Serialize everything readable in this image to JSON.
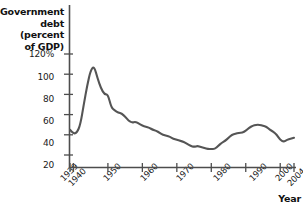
{
  "chart_data": {
    "type": "line",
    "title": "",
    "ylabel": "Government\ndebt (percent\nof GDP)",
    "xlabel": "Year",
    "ytick_labels": [
      "120%",
      "100",
      "80",
      "60",
      "40",
      "20"
    ],
    "ytick_values": [
      120,
      100,
      80,
      60,
      40,
      20
    ],
    "ylim": [
      0,
      130
    ],
    "xtick_labels": [
      "1939",
      "1940",
      "1950",
      "1960",
      "1970",
      "1980",
      "1990",
      "2000",
      "2004"
    ],
    "xtick_values": [
      1939,
      1940,
      1950,
      1960,
      1970,
      1980,
      1990,
      2000,
      2004
    ],
    "xlim": [
      1939,
      2004
    ],
    "grid": false,
    "legend": null,
    "series": [
      {
        "name": "Government debt (percent of GDP)",
        "color": "#555555",
        "x": [
          1939,
          1940,
          1941,
          1942,
          1943,
          1944,
          1945,
          1946,
          1947,
          1948,
          1949,
          1950,
          1951,
          1952,
          1953,
          1954,
          1955,
          1956,
          1957,
          1958,
          1959,
          1960,
          1961,
          1962,
          1963,
          1964,
          1965,
          1966,
          1967,
          1968,
          1969,
          1970,
          1971,
          1972,
          1973,
          1974,
          1975,
          1976,
          1977,
          1978,
          1979,
          1980,
          1981,
          1982,
          1983,
          1984,
          1985,
          1986,
          1987,
          1988,
          1989,
          1990,
          1991,
          1992,
          1993,
          1994,
          1995,
          1996,
          1997,
          1998,
          1999,
          2000,
          2001,
          2002,
          2003,
          2004
        ],
        "y": [
          45,
          41,
          42,
          50,
          70,
          89,
          104,
          108,
          96,
          86,
          80,
          80,
          67,
          64,
          62,
          61,
          58,
          54,
          52,
          53,
          51,
          49,
          48,
          47,
          45,
          44,
          42,
          40,
          39,
          38,
          36,
          35,
          34,
          33,
          31,
          29,
          28,
          29,
          28,
          27,
          26,
          26,
          26,
          29,
          32,
          34,
          37,
          40,
          41,
          42,
          42,
          44,
          47,
          49,
          50,
          50,
          49,
          48,
          45,
          43,
          40,
          35,
          33,
          35,
          36,
          37
        ]
      }
    ]
  },
  "axes": {
    "y_axis_name": "y-axis",
    "x_axis_name": "x-axis"
  }
}
